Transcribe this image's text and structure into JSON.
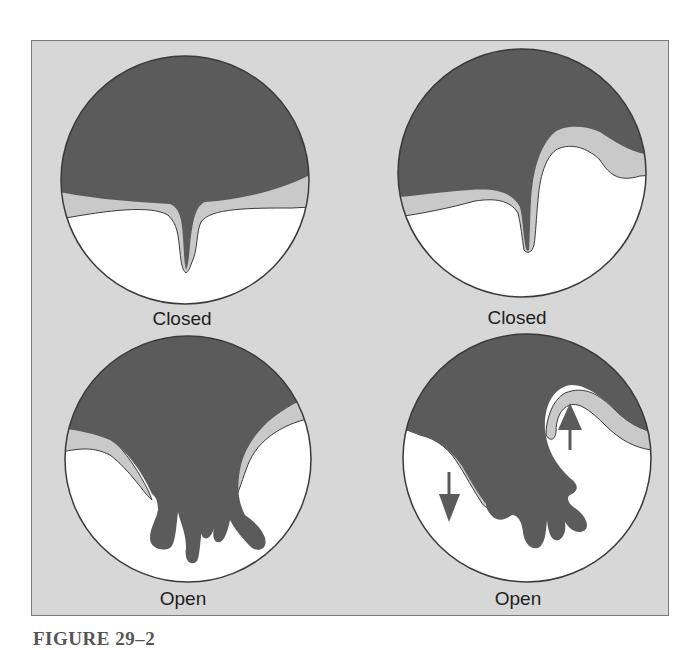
{
  "figure": {
    "caption": "FIGURE 29–2",
    "colors": {
      "background": "#d7d7d7",
      "dark_fill": "#5b5b5b",
      "light_band": "#c9c9c9",
      "interior": "#ffffff",
      "outline": "#3a3a3a"
    },
    "panels": [
      {
        "position": "top-left",
        "label": "Closed",
        "state": "closed",
        "arrows": []
      },
      {
        "position": "top-right",
        "label": "Closed",
        "state": "closed",
        "arrows": []
      },
      {
        "position": "bottom-left",
        "label": "Open",
        "state": "open",
        "arrows": []
      },
      {
        "position": "bottom-right",
        "label": "Open",
        "state": "open",
        "arrows": [
          "down-arrow",
          "up-arrow"
        ]
      }
    ]
  }
}
